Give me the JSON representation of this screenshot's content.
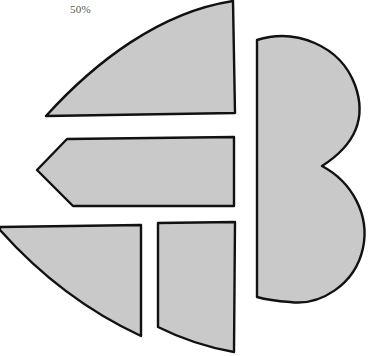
{
  "label": {
    "text": "50%"
  },
  "style": {
    "fill": "#c9c9c9",
    "stroke": "#111111",
    "stroke_width": 2.4
  },
  "pieces": [
    {
      "name": "top-quarter-piece",
      "path": "M46,116 C95,62 160,12 233,1 L235,113 Z"
    },
    {
      "name": "right-heart-piece",
      "path": "M257,297 L257,40 C295,28 340,45 355,85 C367,118 355,145 322,166 C352,182 370,215 363,248 C355,285 320,306 290,302 C275,301 264,299 257,297 Z"
    },
    {
      "name": "middle-arrow-piece",
      "path": "M67,139 L234,137 L234,206 L73,206 L37,170 Z"
    },
    {
      "name": "bottom-left-piece",
      "path": "M0,227 L141,225 L141,336 C85,310 40,275 0,230 Z"
    },
    {
      "name": "bottom-middle-piece",
      "path": "M158,223 L235,222 L234,352 C205,347 180,338 158,327 Z"
    }
  ]
}
